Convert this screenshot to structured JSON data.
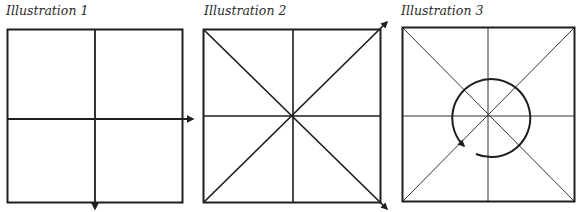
{
  "colors": {
    "ink": "#1e1e1e",
    "background": "#ffffff"
  },
  "illustrations": [
    {
      "caption": "Illustration 1",
      "description": "Square divided into four quadrants by a vertical and a horizontal line; horizontal line extends with an arrow to the right, vertical line extends with an arrow downward",
      "square": {
        "x": 7,
        "y": 29,
        "w": 175,
        "h": 173
      },
      "arrows": [
        "right",
        "down"
      ]
    },
    {
      "caption": "Illustration 2",
      "description": "Square divided by vertical, horizontal and both diagonal lines; diagonals extend with arrows toward top-right and bottom-right corners",
      "square": {
        "x": 203,
        "y": 29,
        "w": 177,
        "h": 173
      },
      "arrows": [
        "up-right",
        "down-right"
      ]
    },
    {
      "caption": "Illustration 3",
      "description": "Square divided by thin vertical, horizontal and diagonal lines, with a circular arrow around the center indicating rotation",
      "square": {
        "x": 402,
        "y": 27,
        "w": 173,
        "h": 175
      },
      "rotation_arrow": "circular"
    }
  ]
}
